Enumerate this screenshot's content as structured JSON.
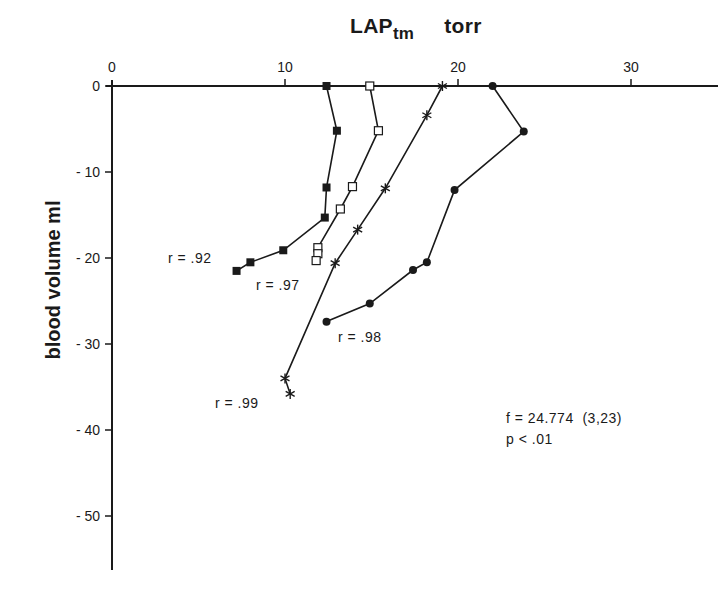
{
  "chart_data": {
    "type": "line",
    "title_main": "LAP",
    "title_sub": "tm",
    "title_unit": "torr",
    "xlabel": "LAP_tm torr",
    "ylabel": "blood volume ml",
    "xlim": [
      0,
      35
    ],
    "ylim": [
      -56,
      0
    ],
    "x_axis_position": "top",
    "xticks": [
      0,
      10,
      20,
      30
    ],
    "xtick_labels": [
      "0",
      "10",
      "20",
      "30"
    ],
    "yticks": [
      0,
      -10,
      -20,
      -30,
      -40,
      -50
    ],
    "ytick_labels": [
      "0",
      "-10",
      "-20",
      "-30",
      "-40",
      "-50"
    ],
    "grid": false,
    "legend": "none (series identified by marker and r annotation)",
    "series": [
      {
        "name": "filled squares",
        "marker": "filled-square",
        "r_label": "r = .92",
        "x": [
          12.4,
          13.0,
          12.4,
          12.3,
          9.9,
          8.0,
          7.2
        ],
        "y": [
          0,
          -5.2,
          -11.8,
          -15.3,
          -19.1,
          -20.5,
          -21.5
        ]
      },
      {
        "name": "open squares",
        "marker": "open-square",
        "r_label": "r = .97",
        "x": [
          14.9,
          15.4,
          13.9,
          13.2,
          11.9,
          11.9,
          11.8
        ],
        "y": [
          0,
          -5.2,
          -11.7,
          -14.3,
          -18.8,
          -19.5,
          -20.3
        ]
      },
      {
        "name": "asterisks",
        "marker": "asterisk",
        "r_label": "r = .99",
        "x": [
          19.1,
          18.2,
          15.8,
          14.2,
          12.9,
          10.0,
          10.3
        ],
        "y": [
          0,
          -3.4,
          -11.9,
          -16.7,
          -20.6,
          -34.0,
          -35.8
        ]
      },
      {
        "name": "filled circles",
        "marker": "filled-circle",
        "r_label": "r = .98",
        "x": [
          22.0,
          23.8,
          19.8,
          18.2,
          17.4,
          14.9,
          12.4
        ],
        "y": [
          0,
          -5.3,
          -12.1,
          -20.5,
          -21.4,
          -25.3,
          -27.4
        ]
      }
    ],
    "annotations": {
      "r_labels": [
        "r = .92",
        "r = .97",
        "r = .99",
        "r = .98"
      ],
      "stat_f": "f = 24.774  (3,23)",
      "stat_p": "p < .01"
    }
  },
  "labels": {
    "r92": "r = .92",
    "r97": "r = .97",
    "r99": "r = .99",
    "r98": "r = .98",
    "stat_f": "f = 24.774  (3,23)",
    "stat_p": "p < .01"
  }
}
